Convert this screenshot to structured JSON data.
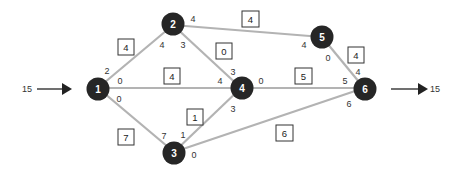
{
  "diagram": {
    "type": "flow-network",
    "source_input": {
      "label": "15",
      "into_node": "1"
    },
    "sink_output": {
      "label": "15",
      "from_node": "6"
    },
    "nodes": [
      {
        "id": "1",
        "label": "1"
      },
      {
        "id": "2",
        "label": "2"
      },
      {
        "id": "3",
        "label": "3"
      },
      {
        "id": "4",
        "label": "4"
      },
      {
        "id": "5",
        "label": "5"
      },
      {
        "id": "6",
        "label": "6"
      }
    ],
    "edges": [
      {
        "from": "1",
        "to": "2",
        "capacity": "4",
        "flow_at_from": "2",
        "flow_at_to": "4"
      },
      {
        "from": "1",
        "to": "4",
        "capacity": "4",
        "flow_at_from": "0",
        "flow_at_to": "4"
      },
      {
        "from": "1",
        "to": "3",
        "capacity": "7",
        "flow_at_from": "0",
        "flow_at_to": "7"
      },
      {
        "from": "2",
        "to": "5",
        "capacity": "4",
        "flow_at_from": "4",
        "flow_at_to": "4"
      },
      {
        "from": "2",
        "to": "4",
        "capacity": "0",
        "flow_at_from": "3",
        "flow_at_to": "3"
      },
      {
        "from": "3",
        "to": "4",
        "capacity": "1",
        "flow_at_from": "1",
        "flow_at_to": "3"
      },
      {
        "from": "3",
        "to": "6",
        "capacity": "6",
        "flow_at_from": "0",
        "flow_at_to": "6"
      },
      {
        "from": "4",
        "to": "6",
        "capacity": "5",
        "flow_at_from": "0",
        "flow_at_to": "5"
      },
      {
        "from": "5",
        "to": "6",
        "capacity": "4",
        "flow_at_from": "0",
        "flow_at_to": "4"
      }
    ]
  }
}
